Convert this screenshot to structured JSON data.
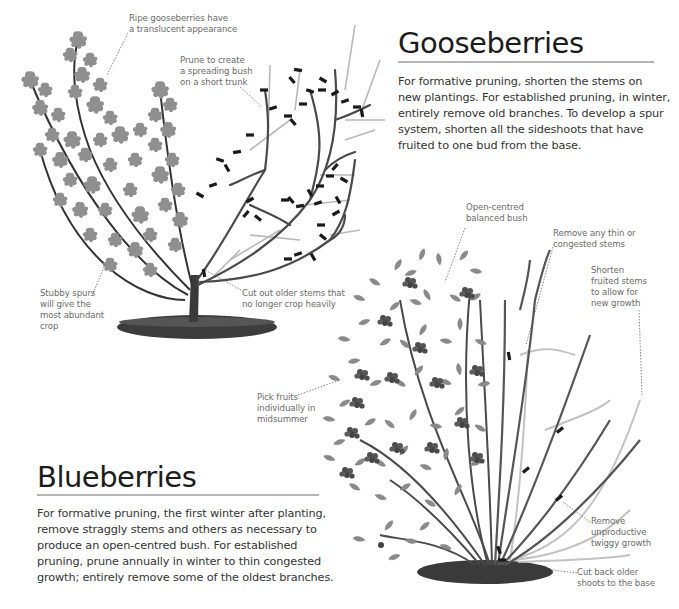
{
  "gooseberries": {
    "title": "Gooseberries",
    "body_lines": [
      "For formative pruning, shorten the stems on",
      "new plantings. For established pruning, in winter,",
      "entirely remove old branches. To develop a spur",
      "system, shorten all the sideshoots that have",
      "fruited to one bud from the base."
    ],
    "callouts": {
      "ripe": [
        "Ripe gooseberries have",
        "a translucent appearance"
      ],
      "prune": [
        "Prune to create",
        "a spreading bush",
        "on a short trunk"
      ],
      "spurs": [
        "Stubby spurs",
        "will give the",
        "most abundant",
        "crop"
      ],
      "cut_out": [
        "Cut out older stems that",
        "no longer crop heavily"
      ]
    }
  },
  "blueberries": {
    "title": "Blueberries",
    "body_lines": [
      "For formative pruning, the first winter after planting,",
      "remove straggly stems and others as necessary to",
      "produce an open-centred bush. For established",
      "pruning, prune annually in winter to thin congested",
      "growth; entirely remove some of the oldest branches."
    ],
    "callouts": {
      "open": [
        "Open-centred",
        "balanced bush"
      ],
      "thin": [
        "Remove any thin or",
        "congested stems"
      ],
      "shorten": [
        "Shorten",
        "fruited stems",
        "to allow for",
        "new growth"
      ],
      "pick": [
        "Pick fruits",
        "individually in",
        "midsummer"
      ],
      "twiggy": [
        "Remove",
        "unproductive",
        "twiggy growth"
      ],
      "cut_back": [
        "Cut back older",
        "shoots to the base"
      ]
    }
  },
  "colors": {
    "title": "#1c1c1c",
    "body": "#333333",
    "callout": "#6b6b6b",
    "rule": "#b5b5b5",
    "leaf": "#8a8a8a",
    "branch": "#3a3a3a",
    "pruned_branch": "#a8a8a8"
  }
}
